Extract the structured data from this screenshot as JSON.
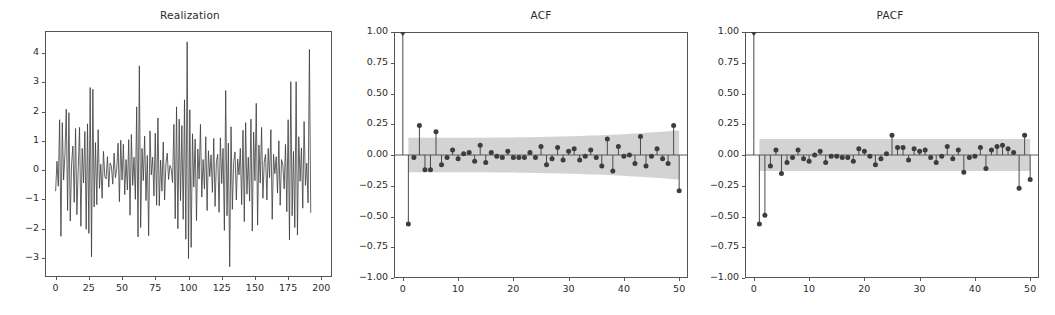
{
  "figure": {
    "background": "#ffffff",
    "axis_color": "#555555",
    "line_color": "#3b3b3b",
    "band_color": "#b8b8b8",
    "marker_color": "#3d3d3d"
  },
  "panels": [
    {
      "title": "Realization",
      "key": "realization"
    },
    {
      "title": "ACF",
      "key": "acf"
    },
    {
      "title": "PACF",
      "key": "pacf"
    }
  ],
  "chart_data": [
    {
      "type": "line",
      "title": "Realization",
      "xlabel": "",
      "ylabel": "",
      "xlim": [
        -8,
        208
      ],
      "ylim": [
        -3.65,
        4.75
      ],
      "grid": false,
      "legend": "none",
      "xticks": [
        0,
        25,
        50,
        75,
        100,
        125,
        150,
        175,
        200
      ],
      "yticks": [
        -3,
        -2,
        -1,
        0,
        1,
        2,
        3,
        4
      ],
      "x": [
        0,
        1,
        2,
        3,
        4,
        5,
        6,
        7,
        8,
        9,
        10,
        11,
        12,
        13,
        14,
        15,
        16,
        17,
        18,
        19,
        20,
        21,
        22,
        23,
        24,
        25,
        26,
        27,
        28,
        29,
        30,
        31,
        32,
        33,
        34,
        35,
        36,
        37,
        38,
        39,
        40,
        41,
        42,
        43,
        44,
        45,
        46,
        47,
        48,
        49,
        50,
        51,
        52,
        53,
        54,
        55,
        56,
        57,
        58,
        59,
        60,
        61,
        62,
        63,
        64,
        65,
        66,
        67,
        68,
        69,
        70,
        71,
        72,
        73,
        74,
        75,
        76,
        77,
        78,
        79,
        80,
        81,
        82,
        83,
        84,
        85,
        86,
        87,
        88,
        89,
        90,
        91,
        92,
        93,
        94,
        95,
        96,
        97,
        98,
        99,
        100,
        101,
        102,
        103,
        104,
        105,
        106,
        107,
        108,
        109,
        110,
        111,
        112,
        113,
        114,
        115,
        116,
        117,
        118,
        119,
        120,
        121,
        122,
        123,
        124,
        125,
        126,
        127,
        128,
        129,
        130,
        131,
        132,
        133,
        134,
        135,
        136,
        137,
        138,
        139,
        140,
        141,
        142,
        143,
        144,
        145,
        146,
        147,
        148,
        149,
        150,
        151,
        152,
        153,
        154,
        155,
        156,
        157,
        158,
        159,
        160,
        161,
        162,
        163,
        164,
        165,
        166,
        167,
        168,
        169,
        170,
        171,
        172,
        173,
        174,
        175,
        176,
        177,
        178,
        179,
        180,
        181,
        182,
        183,
        184,
        185,
        186,
        187,
        188,
        189,
        190,
        191,
        192,
        193,
        194,
        195,
        196,
        197,
        198,
        199
      ],
      "y": [
        -0.72,
        0.3,
        -0.55,
        1.72,
        -2.26,
        1.62,
        -0.34,
        0.52,
        2.08,
        -1.38,
        1.96,
        -1.74,
        0.22,
        0.82,
        -1.1,
        1.42,
        -1.52,
        0.08,
        1.46,
        -1.92,
        0.74,
        -0.44,
        1.32,
        -2.02,
        1.58,
        -2.16,
        2.82,
        -2.96,
        2.76,
        -1.26,
        0.94,
        -1.18,
        1.38,
        -0.62,
        0.2,
        -0.96,
        0.64,
        -0.22,
        -0.3,
        0.46,
        -0.58,
        0.24,
        0.12,
        -0.48,
        0.58,
        -0.26,
        0.06,
        0.92,
        -1.08,
        1.02,
        -0.34,
        0.88,
        -0.84,
        0.36,
        -0.68,
        1.04,
        -1.54,
        1.22,
        -0.52,
        0.44,
        -1.0,
        2.16,
        -2.28,
        3.56,
        -1.96,
        0.74,
        -0.36,
        1.16,
        -1.04,
        0.5,
        -2.24,
        1.34,
        -0.16,
        0.44,
        -0.88,
        1.26,
        -1.2,
        1.78,
        -1.22,
        0.34,
        -0.72,
        0.96,
        -1.02,
        0.22,
        0.58,
        -0.32,
        0.16,
        0.04,
        -0.42,
        1.56,
        -1.66,
        2.16,
        -2.0,
        1.74,
        -1.04,
        1.52,
        -1.68,
        2.4,
        -2.36,
        4.38,
        -3.02,
        2.06,
        -2.64,
        1.24,
        -0.58,
        1.06,
        -1.72,
        0.72,
        -0.3,
        1.56,
        -0.92,
        0.36,
        -0.64,
        1.14,
        -1.38,
        0.66,
        -0.22,
        0.52,
        -0.76,
        1.08,
        -1.24,
        0.3,
        0.54,
        -1.44,
        1.1,
        -0.46,
        0.74,
        -2.06,
        2.72,
        -1.56,
        0.92,
        -3.3,
        1.48,
        -1.34,
        0.26,
        0.62,
        -1.02,
        0.38,
        -0.16,
        0.74,
        -1.18,
        1.36,
        -1.76,
        1.62,
        -0.82,
        0.44,
        -1.06,
        1.74,
        -2.08,
        1.3,
        -0.36,
        2.28,
        -1.88,
        0.86,
        -0.44,
        1.46,
        -0.96,
        0.28,
        0.54,
        -1.02,
        0.74,
        -0.26,
        1.38,
        -1.68,
        0.54,
        -0.12,
        0.46,
        -0.78,
        1.0,
        -1.2,
        0.36,
        0.18,
        -0.64,
        0.88,
        -1.42,
        1.72,
        -2.38,
        3.02,
        -1.56,
        0.64,
        -1.96,
        3.02,
        -2.22,
        1.14,
        -0.38,
        0.76,
        -1.3,
        1.66,
        -0.52,
        0.24,
        -1.12,
        4.12,
        -1.46
      ]
    },
    {
      "type": "stem",
      "title": "ACF",
      "xlabel": "",
      "ylabel": "",
      "xlim": [
        -1.6,
        51.6
      ],
      "ylim": [
        -1.0,
        1.0
      ],
      "grid": false,
      "legend": "none",
      "xticks": [
        0,
        10,
        20,
        30,
        40,
        50
      ],
      "yticks": [
        -1.0,
        -0.75,
        -0.5,
        -0.25,
        0.0,
        0.25,
        0.5,
        0.75,
        1.0
      ],
      "ytick_labels": [
        "-1.00",
        "-0.75",
        "-0.50",
        "-0.25",
        "0.00",
        "0.25",
        "0.50",
        "0.75",
        "1.00"
      ],
      "lags": [
        0,
        1,
        2,
        3,
        4,
        5,
        6,
        7,
        8,
        9,
        10,
        11,
        12,
        13,
        14,
        15,
        16,
        17,
        18,
        19,
        20,
        21,
        22,
        23,
        24,
        25,
        26,
        27,
        28,
        29,
        30,
        31,
        32,
        33,
        34,
        35,
        36,
        37,
        38,
        39,
        40,
        41,
        42,
        43,
        44,
        45,
        46,
        47,
        48,
        49,
        50
      ],
      "values": [
        1.0,
        -0.56,
        -0.02,
        0.24,
        -0.12,
        -0.12,
        0.19,
        -0.08,
        -0.02,
        0.04,
        -0.03,
        0.01,
        0.02,
        -0.05,
        0.08,
        -0.06,
        0.02,
        -0.01,
        -0.02,
        0.03,
        -0.02,
        -0.02,
        -0.02,
        0.02,
        -0.02,
        0.07,
        -0.08,
        -0.03,
        0.06,
        -0.04,
        0.03,
        0.05,
        -0.04,
        -0.01,
        0.04,
        -0.02,
        -0.09,
        0.13,
        -0.13,
        0.07,
        -0.01,
        0.0,
        -0.07,
        0.15,
        -0.09,
        -0.01,
        0.05,
        -0.03,
        -0.07,
        0.24,
        -0.29
      ],
      "conf_band": {
        "upper": 0.14,
        "lower": -0.14,
        "flare_end_upper": 0.2,
        "flare_end_lower": -0.2,
        "note": "shaded 95% confidence band widening slightly with lag"
      }
    },
    {
      "type": "stem",
      "title": "PACF",
      "xlabel": "",
      "ylabel": "",
      "xlim": [
        -1.6,
        51.6
      ],
      "ylim": [
        -1.0,
        1.0
      ],
      "grid": false,
      "legend": "none",
      "xticks": [
        0,
        10,
        20,
        30,
        40,
        50
      ],
      "yticks": [
        -1.0,
        -0.75,
        -0.5,
        -0.25,
        0.0,
        0.25,
        0.5,
        0.75,
        1.0
      ],
      "ytick_labels": [
        "-1.00",
        "-0.75",
        "-0.50",
        "-0.25",
        "0.00",
        "0.25",
        "0.50",
        "0.75",
        "1.00"
      ],
      "lags": [
        0,
        1,
        2,
        3,
        4,
        5,
        6,
        7,
        8,
        9,
        10,
        11,
        12,
        13,
        14,
        15,
        16,
        17,
        18,
        19,
        20,
        21,
        22,
        23,
        24,
        25,
        26,
        27,
        28,
        29,
        30,
        31,
        32,
        33,
        34,
        35,
        36,
        37,
        38,
        39,
        40,
        41,
        42,
        43,
        44,
        45,
        46,
        47,
        48,
        49,
        50
      ],
      "values": [
        1.0,
        -0.56,
        -0.49,
        -0.09,
        0.04,
        -0.15,
        -0.06,
        -0.02,
        0.04,
        -0.03,
        -0.05,
        0.0,
        0.03,
        -0.06,
        -0.01,
        -0.01,
        -0.02,
        -0.02,
        -0.05,
        0.05,
        0.03,
        -0.01,
        -0.08,
        -0.03,
        0.01,
        0.16,
        0.06,
        0.06,
        -0.04,
        0.05,
        0.03,
        0.04,
        -0.02,
        -0.06,
        -0.01,
        0.07,
        -0.03,
        0.04,
        -0.14,
        -0.02,
        -0.01,
        0.06,
        -0.11,
        0.04,
        0.07,
        0.08,
        0.05,
        0.02,
        -0.27,
        0.16,
        -0.2
      ],
      "conf_band": {
        "upper": 0.13,
        "lower": -0.13,
        "note": "shaded 95% confidence band, constant width"
      }
    }
  ]
}
